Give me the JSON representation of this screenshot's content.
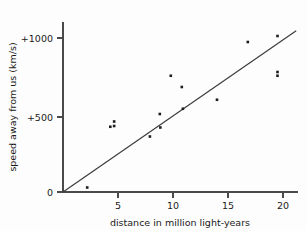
{
  "chart_data": {
    "type": "scatter",
    "title": "",
    "xlabel": "distance in million light-years",
    "ylabel": "speed away from us (km/s)",
    "xlim": [
      0,
      21.5
    ],
    "ylim": [
      0,
      1120
    ],
    "grid": false,
    "legend": "none",
    "xticks": [
      5,
      10,
      15,
      20
    ],
    "xtick_labels": [
      "5",
      "10",
      "15",
      "20"
    ],
    "yticks": [
      0,
      500,
      1000
    ],
    "ytick_labels": [
      "0",
      "+500",
      "+1000"
    ],
    "x": [
      2.2,
      4.3,
      4.65,
      4.65,
      7.9,
      8.8,
      8.85,
      9.8,
      10.8,
      10.9,
      14.0,
      16.8,
      19.5,
      19.5,
      19.5
    ],
    "y": [
      30,
      435,
      470,
      440,
      370,
      520,
      430,
      775,
      700,
      555,
      615,
      1000,
      1040,
      800,
      775
    ],
    "points": [
      {
        "x": 2.2,
        "y": 30
      },
      {
        "x": 4.3,
        "y": 435
      },
      {
        "x": 4.65,
        "y": 470
      },
      {
        "x": 4.65,
        "y": 440
      },
      {
        "x": 7.9,
        "y": 370
      },
      {
        "x": 8.8,
        "y": 520
      },
      {
        "x": 8.85,
        "y": 430
      },
      {
        "x": 9.8,
        "y": 775
      },
      {
        "x": 10.8,
        "y": 700
      },
      {
        "x": 10.9,
        "y": 555
      },
      {
        "x": 14.0,
        "y": 615
      },
      {
        "x": 16.8,
        "y": 1000
      },
      {
        "x": 19.5,
        "y": 1040
      },
      {
        "x": 19.5,
        "y": 800
      },
      {
        "x": 19.5,
        "y": 775
      }
    ],
    "series": [
      {
        "name": "galaxies",
        "values": [
          30,
          435,
          470,
          440,
          370,
          520,
          430,
          775,
          700,
          555,
          615,
          1000,
          1040,
          800,
          775
        ]
      }
    ],
    "trend_line": {
      "name": "best-fit line",
      "x_start": 0.0,
      "y_start": 0,
      "x_end": 21.2,
      "y_end": 1075,
      "slope": 50.7,
      "intercept": 0
    },
    "marker_color": "#1d1d1d",
    "line_color": "#3a3a3a",
    "axis_color": "#4a4a4a"
  },
  "axes": {
    "x_title": "distance in million light-years",
    "y_title": "speed away from us (km/s)"
  },
  "ticks": {
    "x": [
      {
        "label": "5"
      },
      {
        "label": "10"
      },
      {
        "label": "15"
      },
      {
        "label": "20"
      }
    ],
    "y": [
      {
        "label": "0"
      },
      {
        "label": "+500"
      },
      {
        "label": "+1000"
      }
    ]
  }
}
